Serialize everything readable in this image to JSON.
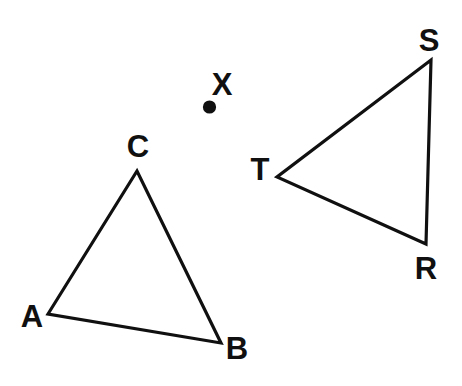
{
  "figure": {
    "background_color": "#ffffff",
    "stroke_color": "#101010",
    "stroke_width": 3.2,
    "width": 462,
    "height": 386
  },
  "shapes": {
    "triangle_abc": {
      "name": "triangle ABC",
      "vertices": [
        {
          "label": "A",
          "x": 48,
          "y": 314
        },
        {
          "label": "B",
          "x": 221,
          "y": 343
        },
        {
          "label": "C",
          "x": 137,
          "y": 171
        }
      ],
      "points_path": "48,314 137,171 221,343"
    },
    "triangle_rst": {
      "name": "triangle RST",
      "vertices": [
        {
          "label": "S",
          "x": 431,
          "y": 60
        },
        {
          "label": "R",
          "x": 426,
          "y": 244
        },
        {
          "label": "T",
          "x": 277,
          "y": 177
        }
      ],
      "points_path": "431,60 426,244 277,177"
    },
    "point_x": {
      "name": "point X",
      "label": "X",
      "x": 209.5,
      "y": 107,
      "radius": 6.6
    }
  },
  "labels": {
    "a": {
      "text": "A",
      "x": 32,
      "y": 316
    },
    "b": {
      "text": "B",
      "x": 237,
      "y": 348
    },
    "c": {
      "text": "C",
      "x": 138,
      "y": 146
    },
    "r": {
      "text": "R",
      "x": 426,
      "y": 268
    },
    "s": {
      "text": "S",
      "x": 429,
      "y": 40
    },
    "t": {
      "text": "T",
      "x": 260,
      "y": 169
    },
    "x": {
      "text": "X",
      "x": 222,
      "y": 84
    }
  }
}
